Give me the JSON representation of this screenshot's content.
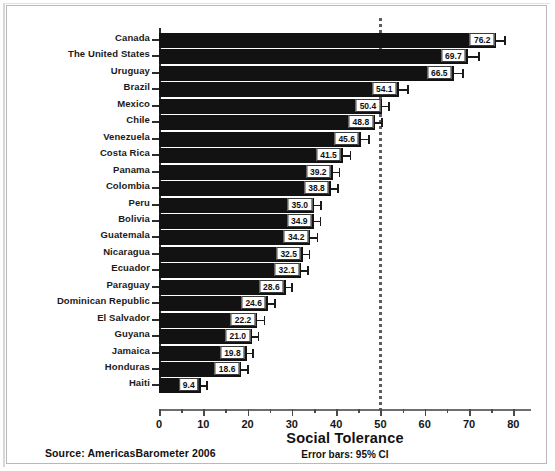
{
  "figure": {
    "source_note": "Source: AmericasBarometer 2006",
    "error_note": "Error bars: 95% CI"
  },
  "chart_data": {
    "type": "bar",
    "orientation": "horizontal",
    "title": "",
    "xlabel": "Social Tolerance",
    "ylabel": "",
    "xlim": [
      0,
      84
    ],
    "xticks": [
      0,
      10,
      20,
      30,
      40,
      50,
      60,
      70,
      80
    ],
    "xtick_labels": [
      "0",
      "10",
      "20",
      "30",
      "40",
      "50",
      "60",
      "70",
      "80"
    ],
    "minor_xticks": [
      5,
      15,
      25,
      35,
      45,
      55,
      65,
      75
    ],
    "grid": false,
    "legend": "none",
    "reference_line": {
      "value": 50,
      "style": "dotted",
      "color": "#5d5d5d"
    },
    "error_bars": "95% CI",
    "categories": [
      "Canada",
      "The United States",
      "Uruguay",
      "Brazil",
      "Mexico",
      "Chile",
      "Venezuela",
      "Costa Rica",
      "Panama",
      "Colombia",
      "Peru",
      "Bolivia",
      "Guatemala",
      "Nicaragua",
      "Ecuador",
      "Paraguay",
      "Dominican Republic",
      "El Salvador",
      "Guyana",
      "Jamaica",
      "Honduras",
      "Haiti"
    ],
    "values": [
      76.2,
      69.7,
      66.5,
      54.1,
      50.4,
      48.8,
      45.6,
      41.5,
      39.2,
      38.8,
      35.0,
      34.9,
      34.2,
      32.5,
      32.1,
      28.6,
      24.6,
      22.2,
      21.0,
      19.8,
      18.6,
      9.4
    ],
    "value_labels": [
      "76.2",
      "69.7",
      "66.5",
      "54.1",
      "50.4",
      "48.8",
      "45.6",
      "41.5",
      "39.2",
      "38.8",
      "35.0",
      "34.9",
      "34.2",
      "32.5",
      "32.1",
      "28.6",
      "24.6",
      "22.2",
      "21.0",
      "19.8",
      "18.6",
      "9.4"
    ],
    "ci_upper": [
      78.0,
      72.1,
      68.5,
      56.0,
      51.8,
      50.2,
      47.2,
      43.1,
      40.6,
      40.3,
      36.4,
      36.3,
      35.6,
      33.8,
      33.5,
      29.9,
      26.0,
      23.6,
      22.3,
      21.1,
      19.9,
      10.7
    ]
  }
}
